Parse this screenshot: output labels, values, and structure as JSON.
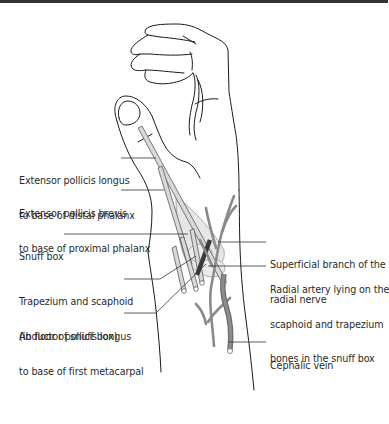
{
  "figure": {
    "colors": {
      "outline": "#1a1a1a",
      "tendon_fill": "#d9d9d9",
      "snuffbox_fill": "#e6e6e6",
      "nerve": "#8a8a8a",
      "vein": "#7a7a7a",
      "artery": "#3a3a3a",
      "leader": "#333333",
      "top_rule": "#333333"
    }
  },
  "labels_left": [
    {
      "id": "epl",
      "line1": "Extensor pollicis longus",
      "line2": "to base of distal phalanx"
    },
    {
      "id": "epb",
      "line1": "Extensor pollicis brevis",
      "line2": "to base of proximal phalanx"
    },
    {
      "id": "snuffbox",
      "line1": "Snuff box",
      "line2": ""
    },
    {
      "id": "trapezium",
      "line1": "Trapezium and scaphoid",
      "line2": "(in floor of snuff box)"
    },
    {
      "id": "apl",
      "line1": "Abductor pollicis longus",
      "line2": "to base of first metacarpal"
    }
  ],
  "labels_right": [
    {
      "id": "nerve",
      "line1": "Superficial branch of the",
      "line2": "radial nerve",
      "line3": ""
    },
    {
      "id": "artery",
      "line1": "Radial artery lying on the",
      "line2": "scaphoid and trapezium",
      "line3": "bones in the snuff box"
    },
    {
      "id": "vein",
      "line1": "Cephalic vein",
      "line2": "",
      "line3": ""
    }
  ]
}
